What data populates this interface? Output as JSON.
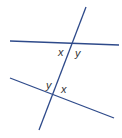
{
  "diagram": {
    "type": "parallel-lines-transversal",
    "line_color": "#2e4a8a",
    "label_color": "#333333",
    "lines": [
      {
        "name": "upper-line",
        "x1": 10,
        "y1": 41,
        "x2": 119,
        "y2": 45
      },
      {
        "name": "lower-line",
        "x1": 10,
        "y1": 78,
        "x2": 114,
        "y2": 118
      },
      {
        "name": "transversal",
        "x1": 86,
        "y1": 7,
        "x2": 39,
        "y2": 130
      }
    ],
    "labels": {
      "upper_left": "x",
      "upper_right": "y",
      "lower_left": "y",
      "lower_right": "x"
    }
  }
}
